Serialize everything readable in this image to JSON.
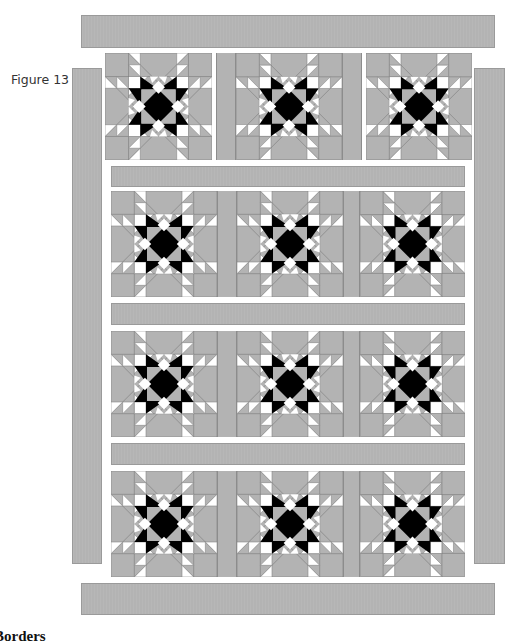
{
  "figure": {
    "label": "Figure 13",
    "colors": {
      "fabric_gray": "#b3b3b3",
      "star_black": "#000000",
      "accent_white": "#ffffff",
      "seam": "#8c8c8c"
    },
    "layout": {
      "rows": 4,
      "columns": 3,
      "block_pattern": "eight-pointed star",
      "total_blocks": 12
    },
    "borders": [
      "top-border",
      "bottom-border",
      "left-border",
      "right-border"
    ],
    "sashing_rows": 3
  },
  "section": {
    "heading": "Borders"
  }
}
